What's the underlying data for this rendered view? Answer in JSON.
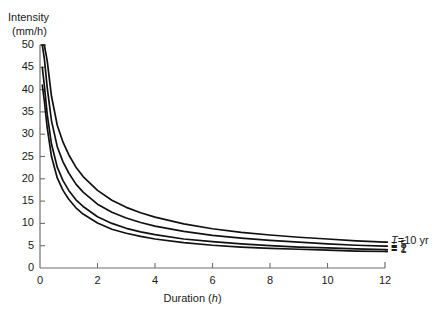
{
  "chart_data": {
    "type": "line",
    "title": "",
    "subtitle": "",
    "xlabel": "Duration (h)",
    "ylabel": "Intensity (mm/h)",
    "ylabel_line1": "Intensity",
    "ylabel_line2": "(mm/h)",
    "xlim": [
      0,
      12
    ],
    "ylim": [
      0,
      50
    ],
    "xticks": [
      0,
      2,
      4,
      6,
      8,
      10,
      12
    ],
    "xticklabels": [
      "0",
      "2",
      "4",
      "6",
      "8",
      "10",
      "12"
    ],
    "yticks": [
      0,
      5,
      10,
      15,
      20,
      25,
      30,
      35,
      40,
      45,
      50
    ],
    "yticklabels": [
      "0",
      "5",
      "10",
      "15",
      "20",
      "25",
      "30",
      "35",
      "40",
      "45",
      "50"
    ],
    "grid": false,
    "legend_position": "right-inside-outside",
    "line_color": "#111111",
    "axis_color": "#6e6e6e",
    "background": "#ffffff",
    "x": [
      0.08,
      0.15,
      0.25,
      0.4,
      0.6,
      0.8,
      1.0,
      1.25,
      1.5,
      2.0,
      2.5,
      3.0,
      3.5,
      4.0,
      5.0,
      6.0,
      7.0,
      8.0,
      9.0,
      10.0,
      11.0,
      12.0
    ],
    "series": [
      {
        "name": "T = 10 yr",
        "label": "T=10 yr",
        "return_period_years": 10,
        "values": [
          50.0,
          50.0,
          46.5,
          38.5,
          32.0,
          28.2,
          25.4,
          22.6,
          20.5,
          17.4,
          15.2,
          13.6,
          12.4,
          11.4,
          9.9,
          8.8,
          8.0,
          7.4,
          6.9,
          6.5,
          6.1,
          5.8
        ]
      },
      {
        "name": "T = 5 yr",
        "label": "= 5",
        "return_period_years": 5,
        "values": [
          50.0,
          47.0,
          40.5,
          33.0,
          27.2,
          23.8,
          21.3,
          18.8,
          17.0,
          14.3,
          12.5,
          11.2,
          10.2,
          9.4,
          8.2,
          7.3,
          6.7,
          6.2,
          5.8,
          5.4,
          5.1,
          4.9
        ]
      },
      {
        "name": "T = 2 yr",
        "label": "= 2",
        "return_period_years": 2,
        "values": [
          45.0,
          41.0,
          34.5,
          27.8,
          22.6,
          19.6,
          17.4,
          15.3,
          13.8,
          11.5,
          10.0,
          8.9,
          8.1,
          7.5,
          6.5,
          5.9,
          5.4,
          5.0,
          4.7,
          4.5,
          4.3,
          4.1
        ]
      },
      {
        "name": "T = 1 yr",
        "label": "= 1",
        "return_period_years": 1,
        "values": [
          41.0,
          37.5,
          31.5,
          25.0,
          20.2,
          17.4,
          15.4,
          13.5,
          12.1,
          10.1,
          8.7,
          7.8,
          7.1,
          6.5,
          5.7,
          5.1,
          4.7,
          4.4,
          4.2,
          4.0,
          3.8,
          3.7
        ]
      }
    ],
    "legend_entries": [
      {
        "prefix": "T",
        "text": "=10 yr"
      },
      {
        "prefix": "",
        "text": "= 5"
      },
      {
        "prefix": "",
        "text": "= 2"
      },
      {
        "prefix": "",
        "text": "= 1"
      }
    ]
  }
}
